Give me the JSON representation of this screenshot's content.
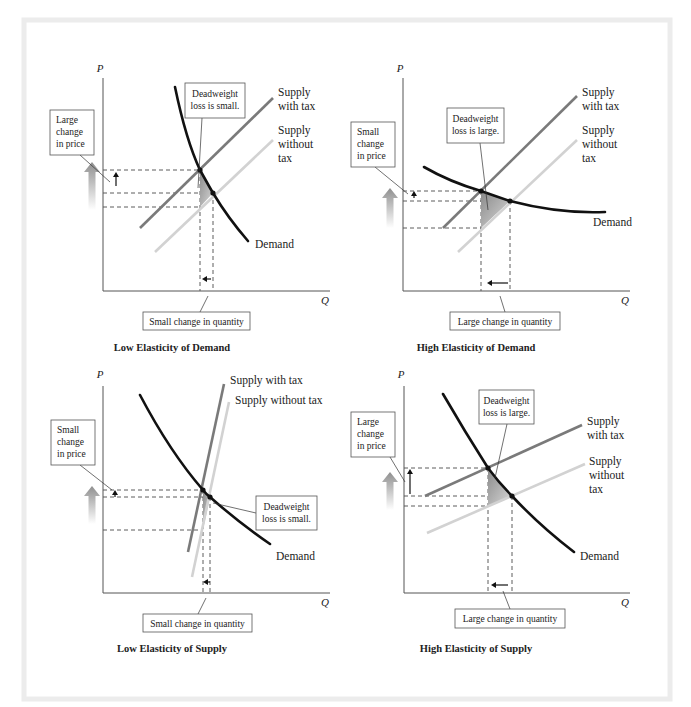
{
  "figure": {
    "frame_color": "#ececec",
    "background": "#ffffff"
  },
  "colors": {
    "demand": "#111111",
    "supply_with_tax": "#7a7a7a",
    "supply_without_tax": "#d2d2d2",
    "deadweight_loss": "#8c8c8c",
    "price_arrow": "#9a9a9a"
  },
  "chart_data": [
    {
      "type": "line",
      "id": "low-elasticity-demand",
      "title": "Low Elasticity of Demand",
      "xlabel": "Q",
      "ylabel": "P",
      "series": [
        {
          "name": "Demand",
          "label": "Demand",
          "shape": "steep-convex"
        },
        {
          "name": "Supply with tax",
          "label_lines": [
            "Supply",
            "with tax"
          ]
        },
        {
          "name": "Supply without tax",
          "label_lines": [
            "Supply",
            "without",
            "tax"
          ]
        }
      ],
      "annotations": {
        "deadweight": [
          "Deadweight",
          "loss is small."
        ],
        "price_change": [
          "Large",
          "change",
          "in price"
        ],
        "quantity_change": "Small change in quantity"
      }
    },
    {
      "type": "line",
      "id": "high-elasticity-demand",
      "title": "High Elasticity of Demand",
      "xlabel": "Q",
      "ylabel": "P",
      "series": [
        {
          "name": "Demand",
          "label": "Demand",
          "shape": "flat-convex"
        },
        {
          "name": "Supply with tax",
          "label_lines": [
            "Supply",
            "with tax"
          ]
        },
        {
          "name": "Supply without tax",
          "label_lines": [
            "Supply",
            "without",
            "tax"
          ]
        }
      ],
      "annotations": {
        "deadweight": [
          "Deadweight",
          "loss is large."
        ],
        "price_change": [
          "Small",
          "change",
          "in price"
        ],
        "quantity_change": "Large change in quantity"
      }
    },
    {
      "type": "line",
      "id": "low-elasticity-supply",
      "title": "Low Elasticity of Supply",
      "xlabel": "Q",
      "ylabel": "P",
      "series": [
        {
          "name": "Demand",
          "label": "Demand",
          "shape": "convex"
        },
        {
          "name": "Supply with tax",
          "label_lines": [
            "Supply with tax"
          ],
          "shape": "steep"
        },
        {
          "name": "Supply without tax",
          "label_lines": [
            "Supply without tax"
          ],
          "shape": "steep"
        }
      ],
      "annotations": {
        "deadweight": [
          "Deadweight",
          "loss is small."
        ],
        "price_change": [
          "Small",
          "change",
          "in price"
        ],
        "quantity_change": "Small change in quantity"
      }
    },
    {
      "type": "line",
      "id": "high-elasticity-supply",
      "title": "High Elasticity of Supply",
      "xlabel": "Q",
      "ylabel": "P",
      "series": [
        {
          "name": "Demand",
          "label": "Demand",
          "shape": "convex"
        },
        {
          "name": "Supply with tax",
          "label_lines": [
            "Supply",
            "with tax"
          ],
          "shape": "flat"
        },
        {
          "name": "Supply without tax",
          "label_lines": [
            "Supply",
            "without",
            "tax"
          ],
          "shape": "flat"
        }
      ],
      "annotations": {
        "deadweight": [
          "Deadweight",
          "loss is large."
        ],
        "price_change": [
          "Large",
          "change",
          "in price"
        ],
        "quantity_change": "Large change in quantity"
      }
    }
  ]
}
